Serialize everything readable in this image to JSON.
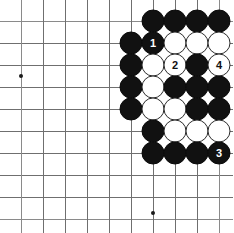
{
  "diagram": {
    "board_type": "go-board",
    "grid": {
      "origin_x": 21,
      "origin_y": 21,
      "spacing": 22,
      "cols": 10,
      "rows": 10,
      "line_color": "#6f6f6f",
      "background": "#ffffff"
    },
    "star_points": [
      {
        "name": "star-point-left",
        "x": 21,
        "y": 76
      },
      {
        "name": "star-point-bottom",
        "x": 153,
        "y": 213
      }
    ],
    "colors": {
      "black_stone": "#111111",
      "white_stone": "#ffffff",
      "white_stone_border": "#2b2b2b",
      "black_label_text": "#ffffff",
      "white_label_text": "#111111"
    },
    "stones": [
      {
        "name": "stone-black-c6-r1",
        "color": "black",
        "x": 153,
        "y": 21,
        "label": ""
      },
      {
        "name": "stone-black-c7-r1",
        "color": "black",
        "x": 175,
        "y": 21,
        "label": ""
      },
      {
        "name": "stone-black-c8-r1",
        "color": "black",
        "x": 197,
        "y": 21,
        "label": ""
      },
      {
        "name": "stone-black-c9-r1",
        "color": "black",
        "x": 219,
        "y": 21,
        "label": ""
      },
      {
        "name": "stone-black-c5-r2",
        "color": "black",
        "x": 131,
        "y": 43,
        "label": ""
      },
      {
        "name": "stone-black-move-1",
        "color": "black",
        "x": 153,
        "y": 43,
        "label": "1"
      },
      {
        "name": "stone-white-c7-r2",
        "color": "white",
        "x": 175,
        "y": 43,
        "label": ""
      },
      {
        "name": "stone-white-c8-r2",
        "color": "white",
        "x": 197,
        "y": 43,
        "label": ""
      },
      {
        "name": "stone-white-c9-r2",
        "color": "white",
        "x": 219,
        "y": 43,
        "label": ""
      },
      {
        "name": "stone-black-c5-r3",
        "color": "black",
        "x": 131,
        "y": 65,
        "label": ""
      },
      {
        "name": "stone-white-c6-r3",
        "color": "white",
        "x": 153,
        "y": 65,
        "label": ""
      },
      {
        "name": "stone-white-move-2",
        "color": "white",
        "x": 175,
        "y": 65,
        "label": "2"
      },
      {
        "name": "stone-black-c8-r3",
        "color": "black",
        "x": 197,
        "y": 65,
        "label": ""
      },
      {
        "name": "stone-white-move-4",
        "color": "white",
        "x": 219,
        "y": 65,
        "label": "4"
      },
      {
        "name": "stone-black-c5-r4",
        "color": "black",
        "x": 131,
        "y": 87,
        "label": ""
      },
      {
        "name": "stone-white-c6-r4",
        "color": "white",
        "x": 153,
        "y": 87,
        "label": ""
      },
      {
        "name": "stone-black-c7-r4",
        "color": "black",
        "x": 175,
        "y": 87,
        "label": ""
      },
      {
        "name": "stone-black-c8-r4",
        "color": "black",
        "x": 197,
        "y": 87,
        "label": ""
      },
      {
        "name": "stone-black-c9-r4",
        "color": "black",
        "x": 219,
        "y": 87,
        "label": ""
      },
      {
        "name": "stone-black-c5-r5",
        "color": "black",
        "x": 131,
        "y": 109,
        "label": ""
      },
      {
        "name": "stone-white-c6-r5",
        "color": "white",
        "x": 153,
        "y": 109,
        "label": ""
      },
      {
        "name": "stone-white-c7-r5",
        "color": "white",
        "x": 175,
        "y": 109,
        "label": ""
      },
      {
        "name": "stone-black-c8-r5",
        "color": "black",
        "x": 197,
        "y": 109,
        "label": ""
      },
      {
        "name": "stone-black-c9-r5",
        "color": "black",
        "x": 219,
        "y": 109,
        "label": ""
      },
      {
        "name": "stone-black-c6-r6",
        "color": "black",
        "x": 153,
        "y": 131,
        "label": ""
      },
      {
        "name": "stone-white-c7-r6",
        "color": "white",
        "x": 175,
        "y": 131,
        "label": ""
      },
      {
        "name": "stone-white-c8-r6",
        "color": "white",
        "x": 197,
        "y": 131,
        "label": ""
      },
      {
        "name": "stone-white-c9-r6",
        "color": "white",
        "x": 219,
        "y": 131,
        "label": ""
      },
      {
        "name": "stone-black-c6-r7",
        "color": "black",
        "x": 153,
        "y": 153,
        "label": ""
      },
      {
        "name": "stone-black-c7-r7",
        "color": "black",
        "x": 175,
        "y": 153,
        "label": ""
      },
      {
        "name": "stone-black-c8-r7",
        "color": "black",
        "x": 197,
        "y": 153,
        "label": ""
      },
      {
        "name": "stone-black-move-3",
        "color": "black",
        "x": 219,
        "y": 153,
        "label": "3"
      }
    ],
    "move_sequence": [
      "1",
      "2",
      "3",
      "4"
    ]
  }
}
